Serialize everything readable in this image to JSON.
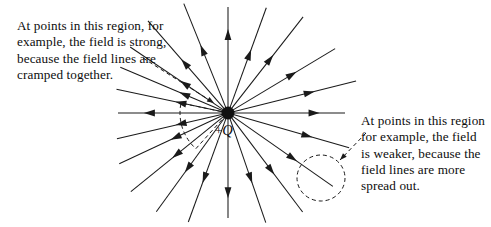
{
  "figure": {
    "type": "physics-field-diagram",
    "background_color": "#ffffff",
    "stroke_color": "#1a1a1a",
    "charge": {
      "label_plus": "+",
      "label_symbol": "Q",
      "center_x": 228,
      "center_y": 113,
      "radius": 6.5,
      "color": "#111111"
    },
    "annotations": {
      "left": {
        "text": "At points in this region, for example, the field is strong, because the field lines are cramped together."
      },
      "right": {
        "text": "At points in this region for example, the field is weaker, because the field lines are more spread out."
      }
    },
    "highlight_regions": [
      {
        "name": "dense-region-wedge",
        "shape": "wedge",
        "style": "dashed",
        "start_angle_deg": 168,
        "end_angle_deg": 228,
        "radius": 48
      },
      {
        "name": "sparse-region-circle",
        "shape": "ellipse",
        "style": "dashed",
        "cx": 321,
        "cy": 178,
        "rx": 24,
        "ry": 23
      }
    ],
    "leader_lines": [
      {
        "name": "left-leader",
        "x1": 143,
        "y1": 58,
        "x2": 214,
        "y2": 103,
        "style": "dashed"
      },
      {
        "name": "right-leader",
        "x1": 366,
        "y1": 133,
        "x2": 340,
        "y2": 160,
        "style": "dashed"
      }
    ],
    "field_lines": [
      {
        "angle_deg": 0,
        "length": 117,
        "arrow_at": 0.77
      },
      {
        "angle_deg": 180,
        "length": 110,
        "arrow_at": 0.75
      },
      {
        "angle_deg": 90,
        "length": 106,
        "arrow_at": 0.78
      },
      {
        "angle_deg": 270,
        "length": 105,
        "arrow_at": 0.8
      },
      {
        "angle_deg": 31,
        "length": 125,
        "arrow_at": 0.62
      },
      {
        "angle_deg": 52,
        "length": 122,
        "arrow_at": 0.58
      },
      {
        "angle_deg": 70,
        "length": 112,
        "arrow_at": 0.58
      },
      {
        "angle_deg": 14,
        "length": 132,
        "arrow_at": 0.66
      },
      {
        "angle_deg": 112,
        "length": 118,
        "arrow_at": 0.6
      },
      {
        "angle_deg": 131,
        "length": 122,
        "arrow_at": 0.56
      },
      {
        "angle_deg": 146,
        "length": 118,
        "arrow_at": 0.46
      },
      {
        "angle_deg": 157,
        "length": 117,
        "arrow_at": 0.42
      },
      {
        "angle_deg": 168,
        "length": 114,
        "arrow_at": 0.44
      },
      {
        "angle_deg": 193,
        "length": 114,
        "arrow_at": 0.44
      },
      {
        "angle_deg": 205,
        "length": 120,
        "arrow_at": 0.5
      },
      {
        "angle_deg": 219,
        "length": 125,
        "arrow_at": 0.55
      },
      {
        "angle_deg": 234,
        "length": 122,
        "arrow_at": 0.58
      },
      {
        "angle_deg": 250,
        "length": 116,
        "arrow_at": 0.62
      },
      {
        "angle_deg": 289,
        "length": 116,
        "arrow_at": 0.62
      },
      {
        "angle_deg": 307,
        "length": 124,
        "arrow_at": 0.6
      },
      {
        "angle_deg": 325,
        "length": 128,
        "arrow_at": 0.64
      },
      {
        "angle_deg": 344,
        "length": 126,
        "arrow_at": 0.68
      }
    ]
  }
}
